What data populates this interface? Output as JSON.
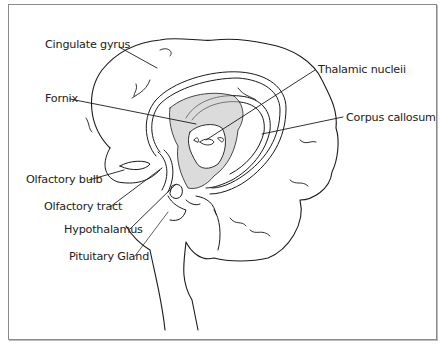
{
  "diagram": {
    "labels": [
      {
        "id": "cingulate-gyrus",
        "text": "Cingulate gyrus",
        "x": 45,
        "y": 45
      },
      {
        "id": "fornix",
        "text": "Fornix",
        "x": 45,
        "y": 93
      },
      {
        "id": "thalamic-nuclei",
        "text": "Thalamic nucleii",
        "x": 318,
        "y": 64
      },
      {
        "id": "corpus-callosum",
        "text": "Corpus callosum",
        "x": 346,
        "y": 112
      },
      {
        "id": "olfactory-bulb",
        "text": "Olfactory bulb",
        "x": 24,
        "y": 174
      },
      {
        "id": "olfactory-tract",
        "text": "Olfactory tract",
        "x": 45,
        "y": 202
      },
      {
        "id": "hypothalamus",
        "text": "Hypothalamus",
        "x": 64,
        "y": 225
      },
      {
        "id": "pituitary-gland",
        "text": "Pituitary Gland",
        "x": 69,
        "y": 252
      }
    ],
    "colors": {
      "ink": "#1a1a1a",
      "frame": "#8a8a8a",
      "background": "#ffffff"
    }
  }
}
